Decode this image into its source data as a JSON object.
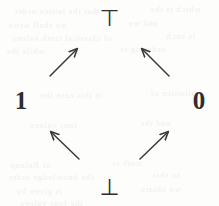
{
  "figure": {
    "kind": "lattice-diagram",
    "stroke_color": "#3a3a3c",
    "text_color": "#2e2e30",
    "background_color": "#fdfdfc"
  },
  "nodes": {
    "top": {
      "label": "⊤",
      "name": "top-element"
    },
    "bottom": {
      "label": "⊥",
      "name": "bottom-element"
    },
    "left": {
      "label": "1",
      "name": "value-one"
    },
    "right": {
      "label": "0",
      "name": "value-zero"
    }
  },
  "arrows": [
    {
      "id": "arrow-one-to-top",
      "from": "1",
      "to": "⊤",
      "direction": "up-right",
      "x1": 50,
      "y1": 76,
      "x2": 77,
      "y2": 49
    },
    {
      "id": "arrow-zero-to-top",
      "from": "0",
      "to": "⊤",
      "direction": "up-left",
      "x1": 169,
      "y1": 76,
      "x2": 142,
      "y2": 49
    },
    {
      "id": "arrow-bottom-to-one",
      "from": "⊥",
      "to": "1",
      "direction": "up-left",
      "x1": 79,
      "y1": 159,
      "x2": 51,
      "y2": 132
    },
    {
      "id": "arrow-bottom-to-zero",
      "from": "⊥",
      "to": "0",
      "direction": "up-right",
      "x1": 140,
      "y1": 159,
      "x2": 168,
      "y2": 132
    }
  ],
  "background_bleed": {
    "note": "Faint mirrored show-through text from the reverse page of the scan",
    "lines": [
      {
        "text": "that the lattice order",
        "x": 14,
        "y": 6
      },
      {
        "text": "which is the",
        "x": 150,
        "y": 4
      },
      {
        "text": "we shall write",
        "x": 8,
        "y": 20
      },
      {
        "text": "and we",
        "x": 128,
        "y": 18
      },
      {
        "text": "of classical truth values",
        "x": 12,
        "y": 33
      },
      {
        "text": "is such",
        "x": 166,
        "y": 31
      },
      {
        "text": "while the",
        "x": 6,
        "y": 46
      },
      {
        "text": "ordering is",
        "x": 120,
        "y": 44
      },
      {
        "text": "in this case the",
        "x": 40,
        "y": 90
      },
      {
        "text": "bilattice of",
        "x": 150,
        "y": 88
      },
      {
        "text": "four values",
        "x": 30,
        "y": 120
      },
      {
        "text": "and the",
        "x": 140,
        "y": 118
      },
      {
        "text": "of Belnap",
        "x": 10,
        "y": 160
      },
      {
        "text": "truth is",
        "x": 112,
        "y": 158
      },
      {
        "text": "the knowledge order",
        "x": 8,
        "y": 172
      },
      {
        "text": "so that",
        "x": 152,
        "y": 170
      },
      {
        "text": "is given by",
        "x": 16,
        "y": 186
      },
      {
        "text": "we obtain",
        "x": 140,
        "y": 184
      },
      {
        "text": "the four values",
        "x": 20,
        "y": 198
      }
    ]
  }
}
